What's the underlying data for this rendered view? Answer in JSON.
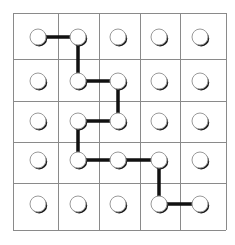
{
  "puzzle": {
    "rows": 5,
    "cols": 5,
    "grid_lines_x": [
      13,
      58,
      99,
      140,
      180,
      226
    ],
    "grid_lines_y": [
      13,
      59,
      101,
      142,
      183,
      230
    ],
    "node_centers_x": [
      38,
      78,
      118,
      159,
      200
    ],
    "node_centers_y": [
      37,
      81,
      121,
      160,
      204
    ],
    "node_radius": 8,
    "colors": {
      "grid": "#8a8a8a",
      "path": "#111111",
      "node_fill": "#ffffff",
      "node_shadow": "#1a1a1a",
      "background": "#ffffff"
    },
    "path": [
      [
        0,
        0
      ],
      [
        0,
        1
      ],
      [
        1,
        1
      ],
      [
        1,
        2
      ],
      [
        2,
        2
      ],
      [
        2,
        1
      ],
      [
        3,
        1
      ],
      [
        3,
        2
      ],
      [
        3,
        3
      ],
      [
        4,
        3
      ],
      [
        4,
        4
      ]
    ]
  }
}
